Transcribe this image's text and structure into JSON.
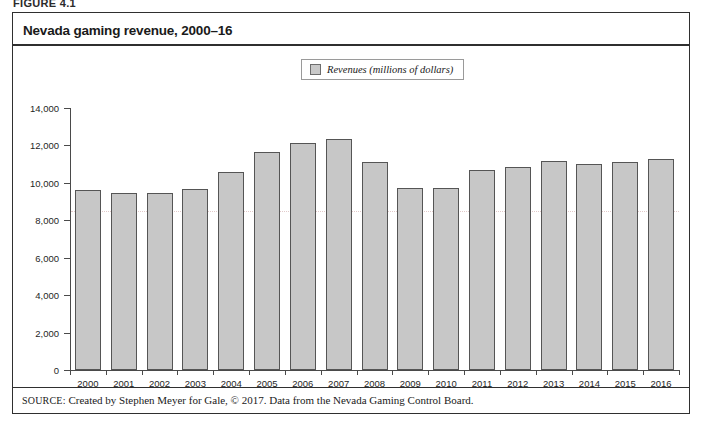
{
  "figure": {
    "label": "FIGURE 4.1",
    "title": "Nevada gaming revenue, 2000–16",
    "source_kicker": "SOURCE:",
    "source_text": "Created by Stephen Meyer for Gale, © 2017. Data from the Nevada Gaming Control Board."
  },
  "legend": {
    "position": "top-center",
    "entries": [
      {
        "label": "Revenues (millions of dollars)",
        "color": "#c7c7c7"
      }
    ]
  },
  "colors": {
    "bar_fill": "#c7c7c7",
    "bar_border": "#555555",
    "axis": "#4a4a4a",
    "frame": "#2f2f2f",
    "gridline": "#d9b9b9",
    "text": "#1a1a1a"
  },
  "chart_data": {
    "type": "bar",
    "title": "Nevada gaming revenue, 2000–16",
    "xlabel": "",
    "ylabel": "",
    "ylim": [
      0,
      14000
    ],
    "yticks": [
      0,
      2000,
      4000,
      6000,
      8000,
      10000,
      12000,
      14000
    ],
    "ytick_labels": [
      "0",
      "2,000",
      "4,000",
      "6,000",
      "8,000",
      "10,000",
      "12,000",
      "14,000"
    ],
    "grid": true,
    "legend_position": "top-center",
    "categories": [
      "2000",
      "2001",
      "2002",
      "2003",
      "2004",
      "2005",
      "2006",
      "2007",
      "2008",
      "2009",
      "2010",
      "2011",
      "2012",
      "2013",
      "2014",
      "2015",
      "2016"
    ],
    "series": [
      {
        "name": "Revenues (millions of dollars)",
        "values": [
          9600,
          9475,
          9450,
          9650,
          10560,
          11650,
          12120,
          12340,
          11100,
          9750,
          9700,
          10700,
          10860,
          11150,
          11000,
          11100,
          11300
        ]
      }
    ]
  }
}
